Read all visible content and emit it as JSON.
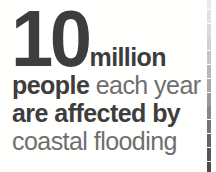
{
  "callout": {
    "headline": {
      "number": "10",
      "unit": "million"
    },
    "lines": [
      {
        "bold_text": "people",
        "regular_text": " each year"
      },
      {
        "bold_text": "are affected by",
        "regular_text": ""
      },
      {
        "bold_text": "",
        "regular_text": "coastal flooding"
      }
    ],
    "full_sentence": "10 million people each year are affected by coastal flooding"
  },
  "divider": {
    "name": "dashed-vertical-rule",
    "style": "dashed",
    "dash_count": 13,
    "colors_top_to_bottom": [
      "#e9e9e9",
      "#e2e2e2",
      "#dadada",
      "#d2d2d2",
      "#c6c6c6",
      "#b8b8b8",
      "#a9a9a9",
      "#999999",
      "#888888",
      "#757575",
      "#646464",
      "#565656",
      "#4b4b4b"
    ]
  },
  "colors": {
    "background": "#fffffe",
    "bold_text": "#3d3d3d",
    "regular_text": "#6f6f6f",
    "big_number": "#3d3d3d"
  }
}
